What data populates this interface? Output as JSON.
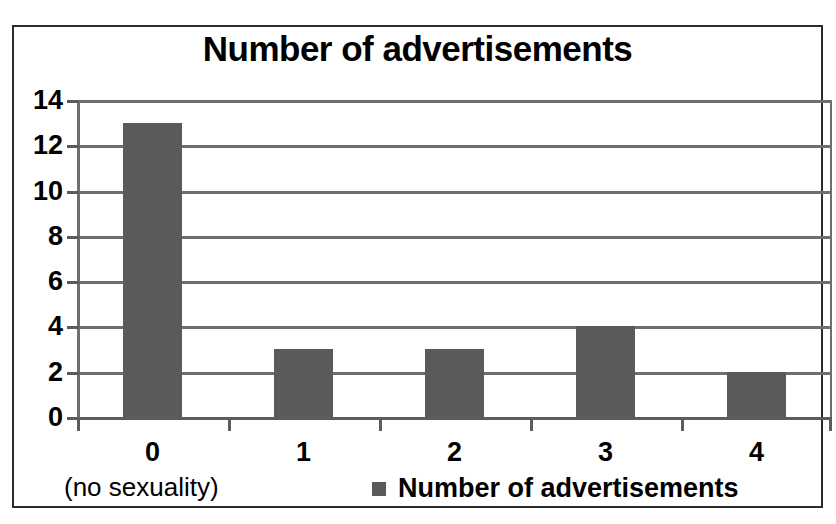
{
  "chart_data": {
    "type": "bar",
    "title": "Number of advertisements",
    "categories": [
      "0",
      "1",
      "2",
      "3",
      "4"
    ],
    "values": [
      13,
      3,
      3,
      4,
      2
    ],
    "series": [
      {
        "name": "Number of advertisements",
        "values": [
          13,
          3,
          3,
          4,
          2
        ]
      }
    ],
    "xlabel": "",
    "ylabel": "",
    "ylim": [
      0,
      14
    ],
    "yticks": [
      0,
      2,
      4,
      6,
      8,
      10,
      12,
      14
    ],
    "ytick_labels": [
      "0",
      "2",
      "4",
      "6",
      "8",
      "10",
      "12",
      "14"
    ],
    "grid": true,
    "legend_position": "bottom-center",
    "legend_entries": [
      {
        "label": "Number of advertisements",
        "color": "#5a5a5a"
      }
    ],
    "annotations": [
      {
        "text": "(no sexuality)",
        "position": "below-first-category"
      }
    ],
    "bar_color": "#5a5a5a",
    "axis_color": "#6e6e6e",
    "frame_color": "#2c2c2c",
    "background": "#ffffff"
  },
  "note": {
    "text": "(no sexuality)"
  },
  "legend": {
    "label": "Number of advertisements"
  }
}
